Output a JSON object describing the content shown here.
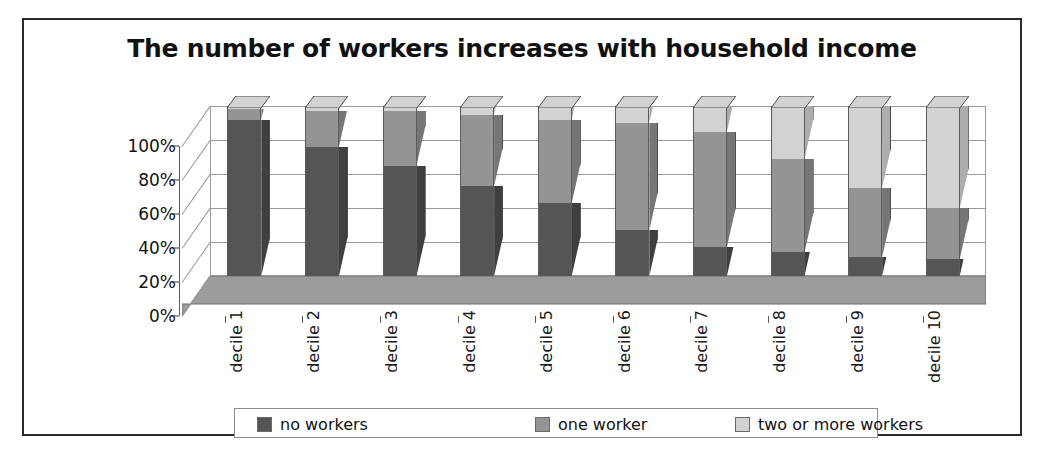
{
  "frame": {
    "border_color": "#2a2a2a"
  },
  "chart_data": {
    "type": "bar",
    "subtype": "stacked-100-percent-3d",
    "title": "The number of workers increases with household income",
    "xlabel": "",
    "ylabel": "",
    "ylim": [
      0,
      100
    ],
    "yticks": [
      "0%",
      "20%",
      "40%",
      "60%",
      "80%",
      "100%"
    ],
    "ytick_values": [
      0,
      20,
      40,
      60,
      80,
      100
    ],
    "grid": true,
    "legend_position": "bottom",
    "categories": [
      "decile 1",
      "decile 2",
      "decile 3",
      "decile 4",
      "decile 5",
      "decile 6",
      "decile 7",
      "decile 8",
      "decile 9",
      "decile 10"
    ],
    "series": [
      {
        "name": "no workers",
        "color": "#555555",
        "values": [
          92,
          76,
          65,
          53,
          43,
          27,
          17,
          14,
          11,
          10
        ]
      },
      {
        "name": "one worker",
        "color": "#949494",
        "values": [
          6,
          21,
          32,
          42,
          49,
          63,
          68,
          55,
          41,
          30
        ]
      },
      {
        "name": "two or more workers",
        "color": "#d2d2d2",
        "values": [
          2,
          3,
          3,
          5,
          8,
          10,
          15,
          31,
          48,
          60
        ]
      }
    ]
  },
  "legend": {
    "items": [
      {
        "label": "no workers",
        "color": "#555555"
      },
      {
        "label": "one worker",
        "color": "#949494"
      },
      {
        "label": "two or more workers",
        "color": "#d2d2d2"
      }
    ]
  }
}
